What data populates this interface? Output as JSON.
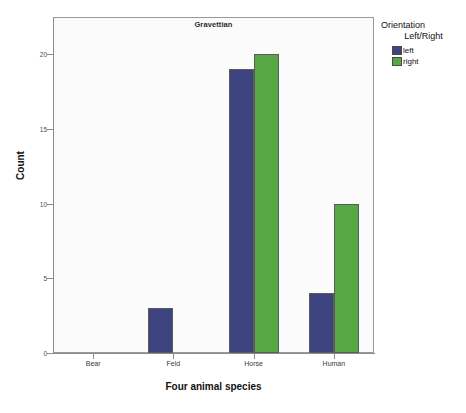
{
  "chart_data": {
    "type": "bar",
    "title": "Gravettian",
    "xlabel": "Four animal species",
    "ylabel": "Count",
    "categories": [
      "Bear",
      "Feld",
      "Horse",
      "Human"
    ],
    "series": [
      {
        "name": "left",
        "color": "#3d4480",
        "values": [
          0,
          3,
          19,
          4
        ]
      },
      {
        "name": "right",
        "color": "#56a845",
        "values": [
          0,
          0,
          20,
          10
        ]
      }
    ],
    "ylim": [
      0,
      22.5
    ],
    "yticks": [
      0,
      5,
      10,
      15,
      20
    ],
    "ytick_labels": [
      "0",
      "5",
      "10",
      "15",
      "20"
    ],
    "grid": false,
    "legend_position": "right",
    "legend": {
      "title_line1": "Orientation",
      "title_line2": "Left/Right",
      "entries": [
        "left",
        "right"
      ]
    },
    "plot_background": "#fbfbfb",
    "frame_color": "#9a9a9a"
  }
}
